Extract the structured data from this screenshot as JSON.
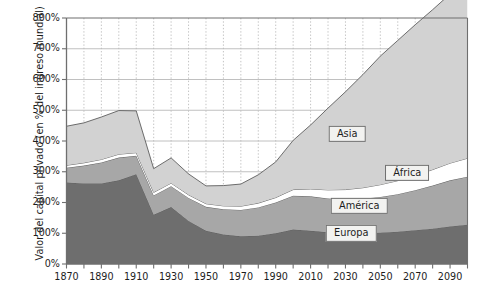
{
  "chart_data": {
    "type": "area",
    "stacked": true,
    "title": "",
    "subtitle": "",
    "xlabel": "",
    "ylabel": "Valor del capital privado (en % del ingreso mundial)",
    "xlim": [
      1870,
      2100
    ],
    "ylim": [
      0,
      800
    ],
    "yunit": "%",
    "grid": "dotted vertical every 10 years, solid horizontal every 100%",
    "legend_position": "inline labels on bands",
    "x": [
      1870,
      1880,
      1890,
      1900,
      1910,
      1920,
      1930,
      1940,
      1950,
      1960,
      1970,
      1980,
      1990,
      2000,
      2010,
      2020,
      2030,
      2040,
      2050,
      2060,
      2070,
      2080,
      2090,
      2100
    ],
    "xticks": [
      1870,
      1880,
      1890,
      1900,
      1910,
      1920,
      1930,
      1940,
      1950,
      1960,
      1970,
      1980,
      1990,
      2000,
      2010,
      2020,
      2030,
      2040,
      2050,
      2060,
      2070,
      2080,
      2090,
      2100
    ],
    "xtick_labels": [
      "1870",
      "",
      "1890",
      "",
      "1910",
      "",
      "1930",
      "",
      "1950",
      "",
      "1970",
      "",
      "1990",
      "",
      "2010",
      "",
      "2030",
      "",
      "2050",
      "",
      "2070",
      "",
      "2090",
      ""
    ],
    "yticks": [
      0,
      100,
      200,
      300,
      400,
      500,
      600,
      700,
      800
    ],
    "ytick_labels": [
      "0%",
      "100%",
      "200%",
      "300%",
      "400%",
      "500%",
      "600%",
      "700%",
      "800%"
    ],
    "series": [
      {
        "name": "Europa",
        "color": "#6e6e6e",
        "values": [
          265,
          262,
          262,
          272,
          292,
          160,
          185,
          140,
          108,
          96,
          90,
          92,
          100,
          112,
          108,
          103,
          100,
          100,
          102,
          105,
          110,
          115,
          122,
          128
        ]
      },
      {
        "name": "América",
        "color": "#a7a7a7",
        "values": [
          48,
          58,
          68,
          74,
          60,
          63,
          68,
          75,
          78,
          82,
          86,
          92,
          100,
          110,
          112,
          110,
          110,
          112,
          116,
          122,
          130,
          140,
          150,
          156
        ]
      },
      {
        "name": "África",
        "color": "#ffffff",
        "values": [
          8,
          9,
          10,
          11,
          10,
          10,
          10,
          10,
          10,
          11,
          12,
          14,
          16,
          20,
          24,
          28,
          32,
          36,
          40,
          44,
          48,
          52,
          56,
          60
        ]
      },
      {
        "name": "Asia",
        "color": "#d2d2d2",
        "values": [
          127,
          130,
          138,
          142,
          136,
          77,
          82,
          68,
          58,
          66,
          72,
          92,
          116,
          160,
          208,
          266,
          318,
          368,
          418,
          456,
          490,
          520,
          550,
          566
        ]
      }
    ],
    "series_totals": [
      448,
      459,
      478,
      499,
      498,
      310,
      345,
      293,
      254,
      255,
      260,
      290,
      332,
      402,
      452,
      507,
      560,
      616,
      676,
      727,
      778,
      827,
      878,
      910
    ],
    "labels_on_plot": [
      {
        "text": "Asia",
        "x_pct": 0.7,
        "y_pct": 0.47
      },
      {
        "text": "África",
        "x_pct": 0.85,
        "y_pct": 0.63
      },
      {
        "text": "América",
        "x_pct": 0.73,
        "y_pct": 0.765
      },
      {
        "text": "Europa",
        "x_pct": 0.71,
        "y_pct": 0.875
      }
    ]
  },
  "axis": {
    "y_title": "Valor del capital privado (en % del ingreso mundial)",
    "y_labels": [
      "800%",
      "700%",
      "600%",
      "500%",
      "400%",
      "300%",
      "200%",
      "100%",
      "0%"
    ],
    "x_labels": [
      "1870",
      "1890",
      "1910",
      "1930",
      "1950",
      "1970",
      "1990",
      "2010",
      "2030",
      "2050",
      "2070",
      "2090"
    ]
  },
  "series_labels": {
    "asia": "Asia",
    "africa": "África",
    "america": "América",
    "europa": "Europa"
  },
  "colors": {
    "asia": "#d2d2d2",
    "america": "#a7a7a7",
    "africa": "#ffffff",
    "europa": "#6e6e6e",
    "frame": "#6f6f6f",
    "grid_solid": "#b9b9b9",
    "grid_dotted": "#bdbdbd",
    "band_outline": "#5e5e5e",
    "text": "#1d1d1d"
  }
}
